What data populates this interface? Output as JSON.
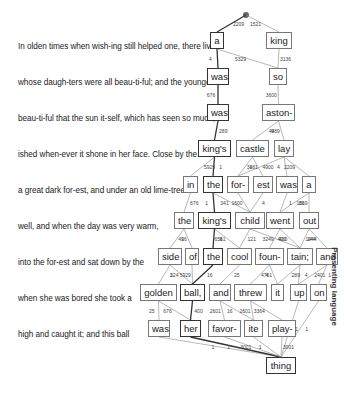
{
  "side_label": "Presenting language",
  "text_lines": [
    {
      "text": "In olden times when wish-ing still helped one, there lived",
      "y": 48
    },
    {
      "text": "whose daugh-ters were all beau-ti-ful; and the youngest",
      "y": 84
    },
    {
      "text": "beau-ti-ful that the sun it-self, which has seen so much,",
      "y": 120
    },
    {
      "text": "ished when-ever it shone in her face. Close by the",
      "y": 156
    },
    {
      "text": "a great dark for-est, and under an old lime-tree",
      "y": 192
    },
    {
      "text": "well, and when the day was very warm,",
      "y": 228
    },
    {
      "text": "into the for-est and sat down by the",
      "y": 264
    },
    {
      "text": "when she was bored she took a",
      "y": 300
    },
    {
      "text": "high and caught it; and this ball",
      "y": 336
    }
  ],
  "root": {
    "x": 246,
    "y": 15
  },
  "nodes": [
    {
      "id": "a",
      "label": "a",
      "x": 210,
      "y": 40,
      "w": 14,
      "bold": true
    },
    {
      "id": "king",
      "label": "king",
      "x": 266,
      "y": 40,
      "w": 26,
      "bold": false
    },
    {
      "id": "was1",
      "label": "was",
      "x": 207,
      "y": 76,
      "w": 22,
      "bold": true
    },
    {
      "id": "so",
      "label": "so",
      "x": 269,
      "y": 76,
      "w": 18,
      "bold": false
    },
    {
      "id": "was2",
      "label": "was",
      "x": 207,
      "y": 112,
      "w": 22,
      "bold": true
    },
    {
      "id": "aston",
      "label": "aston-",
      "x": 262,
      "y": 112,
      "w": 33,
      "bold": false
    },
    {
      "id": "kings1",
      "label": "king's",
      "x": 198,
      "y": 148,
      "w": 33,
      "bold": true
    },
    {
      "id": "castle",
      "label": "castle",
      "x": 236,
      "y": 148,
      "w": 33,
      "bold": false
    },
    {
      "id": "lay",
      "label": "lay",
      "x": 274,
      "y": 148,
      "w": 20,
      "bold": false
    },
    {
      "id": "in",
      "label": "in",
      "x": 183,
      "y": 184,
      "w": 15,
      "bold": false
    },
    {
      "id": "the1",
      "label": "the",
      "x": 203,
      "y": 184,
      "w": 20,
      "bold": true
    },
    {
      "id": "for",
      "label": "for-",
      "x": 227,
      "y": 184,
      "w": 22,
      "bold": false
    },
    {
      "id": "est",
      "label": "est",
      "x": 253,
      "y": 184,
      "w": 20,
      "bold": false
    },
    {
      "id": "was3",
      "label": "was",
      "x": 276,
      "y": 184,
      "w": 22,
      "bold": false
    },
    {
      "id": "a2",
      "label": "a",
      "x": 302,
      "y": 184,
      "w": 14,
      "bold": false
    },
    {
      "id": "the2",
      "label": "the",
      "x": 174,
      "y": 220,
      "w": 20,
      "bold": false
    },
    {
      "id": "kings2",
      "label": "king's",
      "x": 198,
      "y": 220,
      "w": 33,
      "bold": true
    },
    {
      "id": "child",
      "label": "child",
      "x": 235,
      "y": 220,
      "w": 30,
      "bold": false
    },
    {
      "id": "went",
      "label": "went",
      "x": 266,
      "y": 220,
      "w": 28,
      "bold": false
    },
    {
      "id": "out",
      "label": "out",
      "x": 299,
      "y": 220,
      "w": 20,
      "bold": false
    },
    {
      "id": "side",
      "label": "side",
      "x": 158,
      "y": 256,
      "w": 24,
      "bold": false
    },
    {
      "id": "of",
      "label": "of",
      "x": 185,
      "y": 256,
      "w": 14,
      "bold": false
    },
    {
      "id": "the3",
      "label": "the",
      "x": 203,
      "y": 256,
      "w": 20,
      "bold": true
    },
    {
      "id": "cool",
      "label": "cool",
      "x": 227,
      "y": 256,
      "w": 25,
      "bold": false
    },
    {
      "id": "foun",
      "label": "foun-",
      "x": 255,
      "y": 256,
      "w": 29,
      "bold": false
    },
    {
      "id": "tain",
      "label": "tain;",
      "x": 287,
      "y": 256,
      "w": 26,
      "bold": false
    },
    {
      "id": "and1",
      "label": "and",
      "x": 316,
      "y": 256,
      "w": 22,
      "bold": false
    },
    {
      "id": "golden",
      "label": "golden",
      "x": 140,
      "y": 292,
      "w": 37,
      "bold": false
    },
    {
      "id": "ball",
      "label": "ball,",
      "x": 180,
      "y": 292,
      "w": 25,
      "bold": true
    },
    {
      "id": "and2",
      "label": "and",
      "x": 209,
      "y": 292,
      "w": 22,
      "bold": false
    },
    {
      "id": "threw",
      "label": "threw",
      "x": 234,
      "y": 292,
      "w": 33,
      "bold": false
    },
    {
      "id": "it",
      "label": "it",
      "x": 271,
      "y": 292,
      "w": 13,
      "bold": false
    },
    {
      "id": "up",
      "label": "up",
      "x": 290,
      "y": 292,
      "w": 17,
      "bold": false
    },
    {
      "id": "on",
      "label": "on",
      "x": 310,
      "y": 292,
      "w": 17,
      "bold": false
    },
    {
      "id": "was4",
      "label": "was",
      "x": 148,
      "y": 328,
      "w": 22,
      "bold": false
    },
    {
      "id": "her",
      "label": "her",
      "x": 180,
      "y": 328,
      "w": 21,
      "bold": true
    },
    {
      "id": "favor",
      "label": "favor-",
      "x": 208,
      "y": 328,
      "w": 33,
      "bold": false
    },
    {
      "id": "ite",
      "label": "ite",
      "x": 244,
      "y": 328,
      "w": 19,
      "bold": false
    },
    {
      "id": "play",
      "label": "play-",
      "x": 268,
      "y": 328,
      "w": 28,
      "bold": false
    },
    {
      "id": "thing",
      "label": "thing",
      "x": 266,
      "y": 365,
      "w": 30,
      "bold": true
    }
  ],
  "edges": [
    {
      "from": "root",
      "to": "a",
      "w": "2209",
      "bold": true
    },
    {
      "from": "root",
      "to": "king",
      "w": "1521",
      "bold": false
    },
    {
      "from": "a",
      "to": "was1",
      "w": "4",
      "bold": true
    },
    {
      "from": "a",
      "to": "so",
      "w": "5329",
      "bold": false
    },
    {
      "from": "king",
      "to": "so",
      "w": "3136",
      "bold": false
    },
    {
      "from": "was1",
      "to": "was2",
      "w": "676",
      "bold": true
    },
    {
      "from": "so",
      "to": "aston",
      "w": "3600",
      "bold": false
    },
    {
      "from": "was2",
      "to": "kings1",
      "w": "289",
      "bold": true
    },
    {
      "from": "aston",
      "to": "castle",
      "w": "9",
      "bold": false
    },
    {
      "from": "aston",
      "to": "lay",
      "w": "4489",
      "bold": false
    },
    {
      "from": "kings1",
      "to": "in",
      "w": "5929",
      "bold": false
    },
    {
      "from": "kings1",
      "to": "the1",
      "w": "1",
      "bold": true
    },
    {
      "from": "castle",
      "to": "for",
      "w": "3481",
      "bold": false
    },
    {
      "from": "castle",
      "to": "est",
      "w": "1",
      "bold": false
    },
    {
      "from": "lay",
      "to": "for",
      "w": "4900",
      "bold": false
    },
    {
      "from": "lay",
      "to": "was3",
      "w": "4",
      "bold": false
    },
    {
      "from": "lay",
      "to": "a2",
      "w": "2209",
      "bold": false
    },
    {
      "from": "in",
      "to": "the2",
      "w": "676",
      "bold": false
    },
    {
      "from": "the1",
      "to": "kings2",
      "w": "1",
      "bold": true
    },
    {
      "from": "the1",
      "to": "child",
      "w": "341",
      "bold": false
    },
    {
      "from": "for",
      "to": "child",
      "w": "1600",
      "bold": false
    },
    {
      "from": "est",
      "to": "child",
      "w": "4",
      "bold": false
    },
    {
      "from": "was3",
      "to": "went",
      "w": "1",
      "bold": false
    },
    {
      "from": "a2",
      "to": "went",
      "w": "81",
      "bold": false
    },
    {
      "from": "a2",
      "to": "out",
      "w": "1369",
      "bold": false
    },
    {
      "from": "the2",
      "to": "side",
      "w": "16",
      "bold": false
    },
    {
      "from": "the2",
      "to": "of",
      "w": "49",
      "bold": false
    },
    {
      "from": "kings2",
      "to": "the3",
      "w": "9",
      "bold": true
    },
    {
      "from": "kings2",
      "to": "cool",
      "w": "6561",
      "bold": false
    },
    {
      "from": "child",
      "to": "cool",
      "w": "121",
      "bold": false
    },
    {
      "from": "child",
      "to": "tain",
      "w": "3249",
      "bold": false
    },
    {
      "from": "went",
      "to": "foun",
      "w": "400",
      "bold": false
    },
    {
      "from": "went",
      "to": "tain",
      "w": "400",
      "bold": false
    },
    {
      "from": "out",
      "to": "tain",
      "w": "144",
      "bold": false
    },
    {
      "from": "out",
      "to": "and1",
      "w": "1444",
      "bold": false
    },
    {
      "from": "side",
      "to": "golden",
      "w": "1",
      "bold": false
    },
    {
      "from": "side",
      "to": "ball",
      "w": "324",
      "bold": false
    },
    {
      "from": "of",
      "to": "ball",
      "w": "5929",
      "bold": false
    },
    {
      "from": "the3",
      "to": "ball",
      "w": "16",
      "bold": true
    },
    {
      "from": "cool",
      "to": "and2",
      "w": "25",
      "bold": false
    },
    {
      "from": "foun",
      "to": "threw",
      "w": "4",
      "bold": false
    },
    {
      "from": "foun",
      "to": "it",
      "w": "4761",
      "bold": false
    },
    {
      "from": "tain",
      "to": "it",
      "w": "289",
      "bold": false
    },
    {
      "from": "tain",
      "to": "up",
      "w": "4",
      "bold": false
    },
    {
      "from": "and1",
      "to": "up",
      "w": "2401",
      "bold": false
    },
    {
      "from": "and1",
      "to": "on",
      "w": "1",
      "bold": false
    },
    {
      "from": "golden",
      "to": "was4",
      "w": "25",
      "bold": false
    },
    {
      "from": "golden",
      "to": "her",
      "w": "676",
      "bold": false
    },
    {
      "from": "ball",
      "to": "her",
      "w": "400",
      "bold": true
    },
    {
      "from": "and2",
      "to": "favor",
      "w": "2601",
      "bold": false
    },
    {
      "from": "and2",
      "to": "ite",
      "w": "16",
      "bold": false
    },
    {
      "from": "threw",
      "to": "ite",
      "w": "2601",
      "bold": false
    },
    {
      "from": "threw",
      "to": "play",
      "w": "3364",
      "bold": false
    },
    {
      "from": "was4",
      "to": "thing",
      "w": "1",
      "bold": false
    },
    {
      "from": "her",
      "to": "thing",
      "w": "1",
      "bold": true
    },
    {
      "from": "favor",
      "to": "thing",
      "w": "3001",
      "bold": false
    },
    {
      "from": "ite",
      "to": "thing",
      "w": "1",
      "bold": false
    },
    {
      "from": "play",
      "to": "thing",
      "w": "3001",
      "bold": false
    },
    {
      "from": "up",
      "to": "thing",
      "w": "1",
      "bold": false
    },
    {
      "from": "on",
      "to": "thing",
      "w": "1",
      "bold": false
    }
  ]
}
